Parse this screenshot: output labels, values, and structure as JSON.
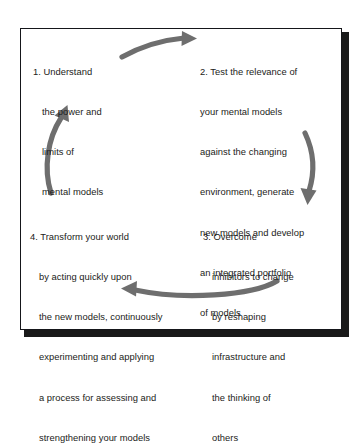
{
  "diagram": {
    "type": "cycle-diagram",
    "frame": {
      "border_color": "#15161a",
      "shadow_color": "#1a1a1a",
      "background": "#ffffff"
    },
    "text_color": "#1b1c20",
    "arrow_color": "#6e6e6e",
    "steps": [
      {
        "id": "step-1",
        "number": "1.",
        "position": "top-left",
        "lines": [
          "1. Understand",
          "the power and",
          "limits of",
          "mental models"
        ]
      },
      {
        "id": "step-2",
        "number": "2.",
        "position": "top-right",
        "lines": [
          "2. Test the relevance of",
          "your mental models",
          "against the changing",
          "environment, generate",
          "new models and develop",
          "an integrated portfolio",
          "of models"
        ]
      },
      {
        "id": "step-3",
        "number": "3.",
        "position": "bottom-right",
        "lines": [
          "3. Overcome",
          "inhibitors to change",
          "by reshaping",
          "infrastructure and",
          "the thinking of",
          "others"
        ]
      },
      {
        "id": "step-4",
        "number": "4.",
        "position": "bottom-left",
        "lines": [
          "4. Transform your world",
          "by acting quickly upon",
          "the new models, continuously",
          "experimenting and applying",
          "a process for assessing and",
          "strengthening your models"
        ]
      }
    ],
    "arrows": [
      {
        "id": "arrow-top",
        "from": "step-1",
        "to": "step-2",
        "direction": "right"
      },
      {
        "id": "arrow-right",
        "from": "step-2",
        "to": "step-3",
        "direction": "down"
      },
      {
        "id": "arrow-bottom",
        "from": "step-3",
        "to": "step-4",
        "direction": "left"
      },
      {
        "id": "arrow-left",
        "from": "step-4",
        "to": "step-1",
        "direction": "up"
      }
    ]
  }
}
